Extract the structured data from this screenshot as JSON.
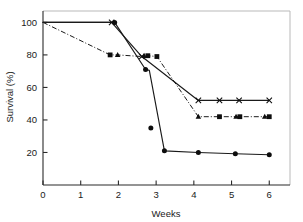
{
  "chart_data": {
    "type": "line",
    "title": "",
    "xlabel": "Weeks",
    "ylabel": "Survival (%)",
    "xlim": [
      0,
      6.55
    ],
    "ylim": [
      0,
      107
    ],
    "xticks": [
      0,
      1,
      2,
      3,
      4,
      5,
      6
    ],
    "xticklabels": [
      "0",
      "1",
      "2",
      "3",
      "4",
      "5",
      "6"
    ],
    "yticks": [
      20,
      40,
      60,
      80,
      100
    ],
    "yticklabels": [
      "20",
      "40",
      "60",
      "80",
      "100"
    ],
    "grid": false,
    "legend": "none",
    "frame": "box",
    "series": [
      {
        "name": "cross-series",
        "marker": "x",
        "linestyle": "solid",
        "x": [
          0,
          1.82,
          2.62,
          4.12,
          4.68,
          5.2,
          6.0
        ],
        "y": [
          100,
          100,
          79,
          52,
          52,
          52,
          52
        ]
      },
      {
        "name": "square-triangle-series",
        "marker": "square-triangle",
        "linestyle": "dashdot",
        "x": [
          0,
          1.78,
          1.98,
          2.62,
          2.78,
          3.02,
          4.12,
          4.68,
          5.12,
          5.22,
          5.88,
          6.0
        ],
        "y": [
          100,
          80,
          80,
          79,
          79.5,
          79,
          42,
          42,
          42,
          42,
          42,
          42
        ]
      },
      {
        "name": "circle-series",
        "marker": "circle",
        "linestyle": "solid",
        "x": [
          0,
          1.9,
          2.72,
          2.82,
          3.22,
          4.12,
          5.1,
          6.0
        ],
        "y": [
          100,
          100,
          71,
          70.5,
          21,
          20,
          19.2,
          18.6
        ]
      }
    ],
    "markers": {
      "cross_points": [
        {
          "x": 1.82,
          "y": 100
        },
        {
          "x": 2.62,
          "y": 79
        },
        {
          "x": 4.12,
          "y": 52
        },
        {
          "x": 4.68,
          "y": 52
        },
        {
          "x": 5.2,
          "y": 52
        },
        {
          "x": 6.0,
          "y": 52
        }
      ],
      "square_points": [
        {
          "x": 1.78,
          "y": 80
        },
        {
          "x": 2.78,
          "y": 79.5
        },
        {
          "x": 3.02,
          "y": 79
        },
        {
          "x": 4.68,
          "y": 42
        },
        {
          "x": 5.22,
          "y": 42
        },
        {
          "x": 6.0,
          "y": 42
        }
      ],
      "triangle_points": [
        {
          "x": 1.98,
          "y": 80
        },
        {
          "x": 2.68,
          "y": 79.5
        },
        {
          "x": 4.12,
          "y": 42
        },
        {
          "x": 5.12,
          "y": 42
        },
        {
          "x": 5.88,
          "y": 42
        }
      ],
      "circle_points": [
        {
          "x": 1.9,
          "y": 100
        },
        {
          "x": 2.72,
          "y": 71
        },
        {
          "x": 2.86,
          "y": 35
        },
        {
          "x": 3.22,
          "y": 21
        },
        {
          "x": 4.12,
          "y": 20
        },
        {
          "x": 5.1,
          "y": 19.2
        },
        {
          "x": 6.0,
          "y": 18.6
        }
      ]
    }
  }
}
